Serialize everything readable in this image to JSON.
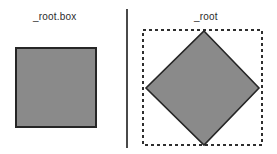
{
  "figure": {
    "width": 277,
    "height": 154,
    "background": "#ffffff"
  },
  "panels": {
    "left": {
      "label": "_root.box",
      "label_x": 33,
      "label_y": 11,
      "shape": {
        "name": "axis-aligned-square",
        "x": 16,
        "y": 48,
        "width": 80,
        "height": 79,
        "fill": "#8a8a8a",
        "stroke": "#262626",
        "stroke_width": 1.6
      }
    },
    "right": {
      "label": "_root",
      "label_x": 194,
      "label_y": 11,
      "bounding_box": {
        "name": "dashed-bounding-box",
        "x": 143,
        "y": 30,
        "width": 119,
        "height": 115,
        "fill": "none",
        "stroke": "#2e2e2e",
        "stroke_width": 1.4,
        "dash": "3 3"
      },
      "shape": {
        "name": "rotated-square-diamond",
        "rotation_deg": 45,
        "points": "204,31 259,88 204,145 146,88",
        "fill": "#8a8a8a",
        "stroke": "#262626",
        "stroke_width": 1.6
      }
    }
  },
  "divider": {
    "name": "vertical-divider",
    "x": 126,
    "y": 9,
    "height": 139,
    "color": "#4a4a4a"
  },
  "colors": {
    "shape_fill": "#8a8a8a",
    "shape_stroke": "#262626",
    "dashed_stroke": "#2e2e2e",
    "text": "#2b2b2b",
    "divider": "#4a4a4a"
  }
}
